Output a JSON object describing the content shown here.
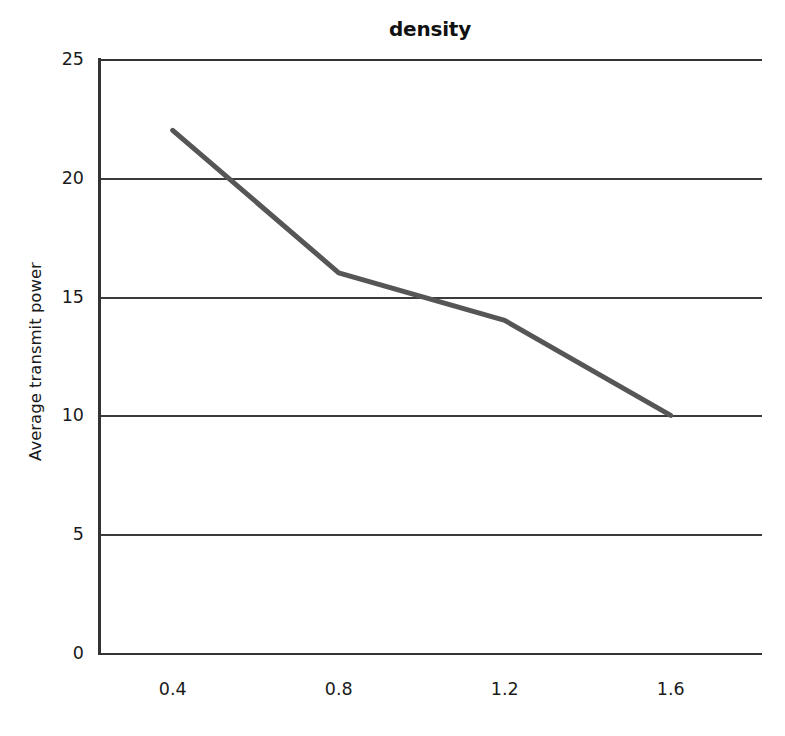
{
  "chart_data": {
    "type": "line",
    "title": "density",
    "xlabel": "",
    "ylabel": "Average transmit power",
    "x": [
      0.4,
      0.8,
      1.2,
      1.6
    ],
    "values": [
      22,
      16,
      14,
      10
    ],
    "series": [
      {
        "name": "Average transmit power",
        "values": [
          22,
          16,
          14,
          10
        ]
      }
    ],
    "x_tick_labels": [
      "0.4",
      "0.8",
      "1.2",
      "1.6"
    ],
    "y_tick_labels": [
      "0",
      "5",
      "10",
      "15",
      "20",
      "25"
    ],
    "y_ticks": [
      0,
      5,
      10,
      15,
      20,
      25
    ],
    "xlim": [
      0.22,
      1.82
    ],
    "ylim": [
      0,
      25
    ],
    "grid": "horizontal",
    "legend": "none",
    "line_color": "#565656",
    "line_width": 5,
    "axis_color": "#333333",
    "gridline_color": "#3b3b3b",
    "background_color": "#ffffff",
    "markers": "none"
  }
}
